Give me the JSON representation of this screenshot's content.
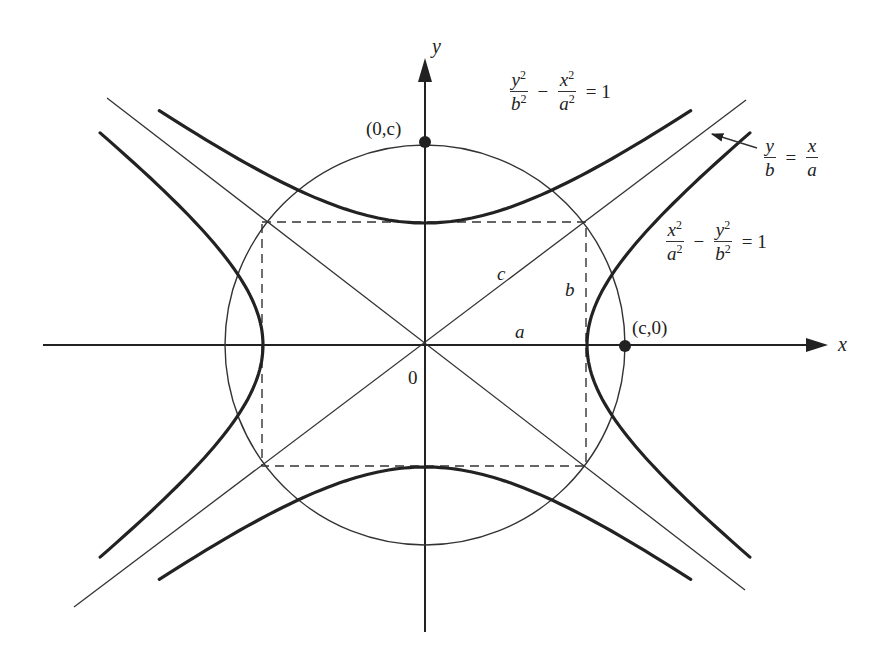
{
  "diagram": {
    "axes": {
      "x_label": "x",
      "y_label": "y",
      "origin_label": "0"
    },
    "points": {
      "top": {
        "label": "(0,c)"
      },
      "right": {
        "label": "(c,0)"
      }
    },
    "segment_labels": {
      "a": "a",
      "b": "b",
      "c": "c"
    },
    "equations": {
      "vertical_hyperbola": {
        "term1_num": "y",
        "term1_den": "b",
        "op": "−",
        "term2_num": "x",
        "term2_den": "a",
        "exp": "2",
        "rhs": "= 1"
      },
      "horizontal_hyperbola": {
        "term1_num": "x",
        "term1_den": "a",
        "op": "−",
        "term2_num": "y",
        "term2_den": "b",
        "exp": "2",
        "rhs": "= 1"
      },
      "asymptote": {
        "left_num": "y",
        "left_den": "b",
        "eq": "=",
        "right_num": "x",
        "right_den": "a"
      }
    },
    "geometry": {
      "center": [
        425,
        345
      ],
      "a": 162,
      "b": 122,
      "c": 200,
      "x_axis": [
        43,
        830
      ],
      "y_axis": [
        60,
        632
      ]
    },
    "colors": {
      "stroke": "#2a2a2a",
      "thin_stroke": "#3a3a3a",
      "background": "#ffffff"
    }
  }
}
